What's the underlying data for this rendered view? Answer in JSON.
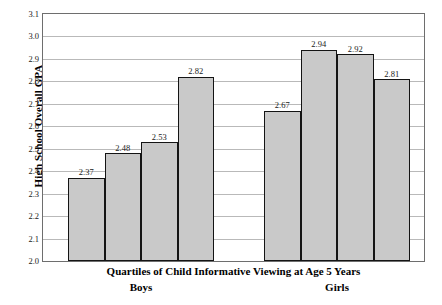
{
  "chart_data": {
    "type": "bar",
    "title": "",
    "xlabel": "Quartiles of Child Informative Viewing at Age 5 Years",
    "ylabel": "High School Overall GPA",
    "ylim": [
      2.0,
      3.1
    ],
    "ytick_step": 0.1,
    "yticks": [
      "3.1",
      "3.0",
      "2.9",
      "2.8",
      "2.7",
      "2.6",
      "2.5",
      "2.4",
      "2.3",
      "2.2",
      "2.1",
      "2.0"
    ],
    "grid": "horizontal",
    "legend": "none",
    "bar_fill": "#c9c9c9",
    "bar_stroke": "#141414",
    "groups": [
      {
        "name": "Boys",
        "label": "Boys",
        "categories": [
          "Q1",
          "Q2",
          "Q3",
          "Q4"
        ],
        "values": [
          2.37,
          2.48,
          2.53,
          2.82
        ],
        "value_labels": [
          "2.37",
          "2.48",
          "2.53",
          "2.82"
        ]
      },
      {
        "name": "Girls",
        "label": "Girls",
        "categories": [
          "Q1",
          "Q2",
          "Q3",
          "Q4"
        ],
        "values": [
          2.67,
          2.94,
          2.92,
          2.81
        ],
        "value_labels": [
          "2.67",
          "2.94",
          "2.92",
          "2.81"
        ]
      }
    ]
  }
}
